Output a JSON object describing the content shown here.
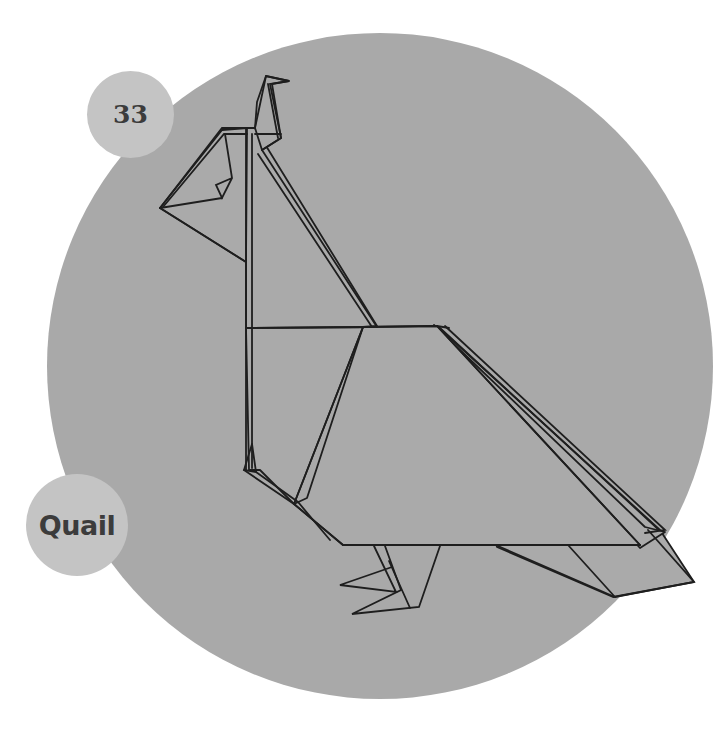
{
  "page": {
    "diagram_number": "33",
    "model_name": "Quail"
  },
  "illustration": {
    "subject": "origami-quail",
    "background_disc_color": "#a9a9a9",
    "label_disc_color": "#c4c4c4",
    "label_text_color": "#3c3c3c",
    "line_color": "#1e1e1e"
  }
}
